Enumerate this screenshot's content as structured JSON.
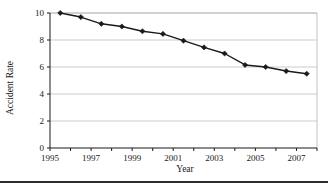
{
  "figure": {
    "background_color": "#ffffff",
    "bottom_rule_color": "#2b2b2b"
  },
  "chart_data": {
    "type": "line",
    "title": "",
    "xlabel": "Year",
    "ylabel": "Accident Rate",
    "xlim": [
      1995,
      2008
    ],
    "ylim": [
      0,
      10
    ],
    "grid": "horizontal",
    "legend": "none",
    "line_color": "#1a1a1a",
    "marker": "diamond",
    "marker_color": "#1a1a1a",
    "gridline_color": "#b4b4b4",
    "axis_color": "#1a1a1a",
    "x_tick_labels": [
      "1995",
      "1997",
      "1999",
      "2001",
      "2003",
      "2005",
      "2007"
    ],
    "x_tick_values": [
      1995,
      1997,
      1999,
      2001,
      2003,
      2005,
      2007
    ],
    "x_minor_tick_values": [
      1996,
      1998,
      2000,
      2002,
      2004,
      2006,
      2008
    ],
    "y_tick_labels": [
      "0",
      "2",
      "4",
      "6",
      "8",
      "10"
    ],
    "y_tick_values": [
      0,
      2,
      4,
      6,
      8,
      10
    ],
    "x": [
      1995.5,
      1996.5,
      1997.5,
      1998.5,
      1999.5,
      2000.5,
      2001.5,
      2002.5,
      2003.5,
      2004.5,
      2005.5,
      2006.5,
      2007.5
    ],
    "values": [
      10.0,
      9.7,
      9.2,
      9.0,
      8.65,
      8.45,
      7.95,
      7.45,
      7.0,
      6.15,
      6.0,
      5.7,
      5.5
    ],
    "series": [
      {
        "name": "Accident Rate",
        "values": [
          10.0,
          9.7,
          9.2,
          9.0,
          8.65,
          8.45,
          7.95,
          7.45,
          7.0,
          6.15,
          6.0,
          5.7,
          5.5
        ]
      }
    ]
  }
}
